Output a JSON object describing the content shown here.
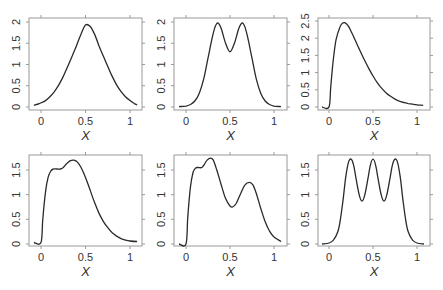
{
  "chart_data": [
    {
      "type": "line",
      "panel": "top-left",
      "title": "",
      "xlabel": "X",
      "ylabel": "",
      "xlim": [
        -0.1,
        1.1
      ],
      "ylim": [
        0,
        2
      ],
      "xticks": [
        0,
        0.5,
        1
      ],
      "xtick_labels": [
        "0",
        "0.5",
        "1"
      ],
      "yticks": [
        0,
        0.5,
        1,
        1.5,
        2
      ],
      "ytick_labels": [
        "0",
        "0.5",
        "1",
        "1.5",
        "2"
      ],
      "grid": false,
      "x": [
        -0.08,
        -0.02,
        0.05,
        0.1,
        0.15,
        0.2,
        0.25,
        0.3,
        0.35,
        0.4,
        0.45,
        0.5,
        0.55,
        0.6,
        0.65,
        0.7,
        0.75,
        0.8,
        0.85,
        0.9,
        0.95,
        1.0,
        1.05,
        1.08
      ],
      "y": [
        0.04,
        0.08,
        0.15,
        0.24,
        0.36,
        0.52,
        0.72,
        0.95,
        1.2,
        1.45,
        1.72,
        1.93,
        1.9,
        1.72,
        1.45,
        1.2,
        0.95,
        0.72,
        0.52,
        0.36,
        0.24,
        0.15,
        0.08,
        0.05
      ]
    },
    {
      "type": "line",
      "panel": "top-middle",
      "title": "",
      "xlabel": "X",
      "ylabel": "",
      "xlim": [
        -0.1,
        1.1
      ],
      "ylim": [
        0,
        2
      ],
      "xticks": [
        0,
        0.5,
        1
      ],
      "xtick_labels": [
        "0",
        "0.5",
        "1"
      ],
      "yticks": [
        0,
        0.5,
        1,
        1.5,
        2
      ],
      "ytick_labels": [
        "0",
        "0.5",
        "1",
        "1.5",
        "2"
      ],
      "grid": false,
      "x": [
        -0.08,
        0.0,
        0.05,
        0.1,
        0.15,
        0.2,
        0.25,
        0.3,
        0.33,
        0.36,
        0.4,
        0.45,
        0.5,
        0.55,
        0.6,
        0.64,
        0.67,
        0.7,
        0.75,
        0.8,
        0.85,
        0.9,
        0.95,
        1.0,
        1.08
      ],
      "y": [
        0.01,
        0.02,
        0.06,
        0.14,
        0.32,
        0.65,
        1.15,
        1.65,
        1.88,
        1.98,
        1.85,
        1.5,
        1.3,
        1.5,
        1.85,
        1.98,
        1.88,
        1.65,
        1.15,
        0.65,
        0.32,
        0.14,
        0.06,
        0.02,
        0.01
      ]
    },
    {
      "type": "line",
      "panel": "top-right",
      "title": "",
      "xlabel": "X",
      "ylabel": "",
      "xlim": [
        -0.1,
        1.1
      ],
      "ylim": [
        0,
        2.5
      ],
      "xticks": [
        0,
        0.5,
        1
      ],
      "xtick_labels": [
        "0",
        "0.5",
        "1"
      ],
      "yticks": [
        0,
        0.5,
        1,
        1.5,
        2,
        2.5
      ],
      "ytick_labels": [
        "0",
        "0.5",
        "1",
        "1.5",
        "2",
        "2.5"
      ],
      "grid": false,
      "x": [
        -0.08,
        0.0,
        0.02,
        0.05,
        0.08,
        0.12,
        0.15,
        0.18,
        0.22,
        0.26,
        0.3,
        0.35,
        0.4,
        0.45,
        0.5,
        0.55,
        0.6,
        0.65,
        0.7,
        0.75,
        0.8,
        0.85,
        0.9,
        0.95,
        1.0,
        1.07
      ],
      "y": [
        0.0,
        0.0,
        0.6,
        1.4,
        1.95,
        2.3,
        2.43,
        2.45,
        2.35,
        2.15,
        1.93,
        1.65,
        1.38,
        1.13,
        0.9,
        0.7,
        0.54,
        0.41,
        0.31,
        0.23,
        0.17,
        0.13,
        0.1,
        0.08,
        0.06,
        0.05
      ]
    },
    {
      "type": "line",
      "panel": "bottom-left",
      "title": "",
      "xlabel": "X",
      "ylabel": "",
      "xlim": [
        -0.1,
        1.1
      ],
      "ylim": [
        0,
        1.7
      ],
      "xticks": [
        0,
        0.5,
        1
      ],
      "xtick_labels": [
        "0",
        "0.5",
        "1"
      ],
      "yticks": [
        0,
        0.5,
        1,
        1.5
      ],
      "ytick_labels": [
        "0",
        "0.5",
        "1",
        "1.5"
      ],
      "grid": false,
      "x": [
        -0.08,
        0.0,
        0.02,
        0.05,
        0.08,
        0.11,
        0.14,
        0.18,
        0.22,
        0.25,
        0.29,
        0.33,
        0.37,
        0.41,
        0.45,
        0.5,
        0.55,
        0.6,
        0.65,
        0.7,
        0.75,
        0.8,
        0.85,
        0.9,
        0.95,
        1.0,
        1.08
      ],
      "y": [
        0.03,
        0.03,
        0.5,
        1.05,
        1.35,
        1.48,
        1.52,
        1.52,
        1.52,
        1.55,
        1.63,
        1.69,
        1.7,
        1.66,
        1.55,
        1.35,
        1.1,
        0.85,
        0.63,
        0.46,
        0.33,
        0.23,
        0.16,
        0.11,
        0.08,
        0.06,
        0.05
      ]
    },
    {
      "type": "line",
      "panel": "bottom-middle",
      "title": "",
      "xlabel": "X",
      "ylabel": "",
      "xlim": [
        -0.1,
        1.1
      ],
      "ylim": [
        0,
        1.75
      ],
      "xticks": [
        0,
        0.5,
        1
      ],
      "xtick_labels": [
        "0",
        "0.5",
        "1"
      ],
      "yticks": [
        0,
        0.5,
        1,
        1.5
      ],
      "ytick_labels": [
        "0",
        "0.5",
        "1",
        "1.5"
      ],
      "grid": false,
      "x": [
        -0.08,
        0.0,
        0.02,
        0.05,
        0.08,
        0.11,
        0.14,
        0.18,
        0.21,
        0.24,
        0.28,
        0.31,
        0.35,
        0.4,
        0.45,
        0.5,
        0.53,
        0.57,
        0.62,
        0.67,
        0.72,
        0.76,
        0.8,
        0.85,
        0.9,
        0.95,
        1.0,
        1.08
      ],
      "y": [
        0.0,
        0.0,
        0.55,
        1.15,
        1.45,
        1.54,
        1.55,
        1.55,
        1.62,
        1.7,
        1.74,
        1.7,
        1.5,
        1.2,
        0.92,
        0.77,
        0.75,
        0.82,
        1.02,
        1.2,
        1.25,
        1.2,
        1.02,
        0.72,
        0.45,
        0.26,
        0.14,
        0.05
      ]
    },
    {
      "type": "line",
      "panel": "bottom-right",
      "title": "",
      "xlabel": "X",
      "ylabel": "",
      "xlim": [
        -0.1,
        1.1
      ],
      "ylim": [
        0,
        1.75
      ],
      "xticks": [
        0,
        0.5,
        1
      ],
      "xtick_labels": [
        "0",
        "0.5",
        "1"
      ],
      "yticks": [
        0,
        0.5,
        1,
        1.5
      ],
      "ytick_labels": [
        "0",
        "0.5",
        "1",
        "1.5"
      ],
      "grid": false,
      "x": [
        -0.08,
        0.0,
        0.05,
        0.1,
        0.13,
        0.16,
        0.19,
        0.22,
        0.25,
        0.28,
        0.31,
        0.345,
        0.375,
        0.405,
        0.44,
        0.47,
        0.5,
        0.53,
        0.56,
        0.595,
        0.625,
        0.655,
        0.69,
        0.72,
        0.75,
        0.78,
        0.81,
        0.84,
        0.87,
        0.9,
        0.95,
        1.0,
        1.08
      ],
      "y": [
        0.0,
        0.02,
        0.08,
        0.25,
        0.5,
        0.9,
        1.35,
        1.65,
        1.72,
        1.6,
        1.3,
        0.98,
        0.87,
        0.98,
        1.3,
        1.6,
        1.72,
        1.6,
        1.3,
        0.98,
        0.87,
        0.98,
        1.3,
        1.6,
        1.72,
        1.65,
        1.35,
        0.9,
        0.5,
        0.25,
        0.08,
        0.02,
        0.0
      ]
    }
  ],
  "panels": [
    {
      "xlabel": "X",
      "yticks": [
        "0",
        "0.5",
        "1",
        "1.5",
        "2"
      ],
      "xticks": [
        "0",
        "0.5",
        "1"
      ]
    },
    {
      "xlabel": "X",
      "yticks": [
        "0",
        "0.5",
        "1",
        "1.5",
        "2"
      ],
      "xticks": [
        "0",
        "0.5",
        "1"
      ]
    },
    {
      "xlabel": "X",
      "yticks": [
        "0",
        "0.5",
        "1",
        "1.5",
        "2",
        "2.5"
      ],
      "xticks": [
        "0",
        "0.5",
        "1"
      ]
    },
    {
      "xlabel": "X",
      "yticks": [
        "0",
        "0.5",
        "1",
        "1.5"
      ],
      "xticks": [
        "0",
        "0.5",
        "1"
      ]
    },
    {
      "xlabel": "X",
      "yticks": [
        "0",
        "0.5",
        "1",
        "1.5"
      ],
      "xticks": [
        "0",
        "0.5",
        "1"
      ]
    },
    {
      "xlabel": "X",
      "yticks": [
        "0",
        "0.5",
        "1",
        "1.5"
      ],
      "xticks": [
        "0",
        "0.5",
        "1"
      ]
    }
  ],
  "colors": {
    "curve": "#2a2a2a",
    "frame": "#9a9a9a",
    "text": "#333333",
    "background": "#ffffff"
  }
}
